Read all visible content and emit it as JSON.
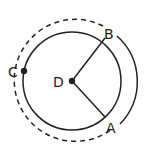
{
  "diagram": {
    "type": "geometry-circle",
    "points": {
      "A": {
        "label": "A",
        "x": 105,
        "y": 117
      },
      "B": {
        "label": "B",
        "x": 105,
        "y": 38
      },
      "C": {
        "label": "C",
        "x": 24,
        "y": 71
      },
      "D": {
        "label": "D",
        "x": 72,
        "y": 81
      }
    },
    "circle": {
      "cx": 72,
      "cy": 81,
      "r": 49
    },
    "outer_arc": {
      "cx": 75,
      "cy": 80,
      "r": 61,
      "dashed_part": "major arc through C",
      "solid_part": "arc from B to A"
    },
    "colors": {
      "stroke": "#222222",
      "background": "#ffffff"
    }
  }
}
